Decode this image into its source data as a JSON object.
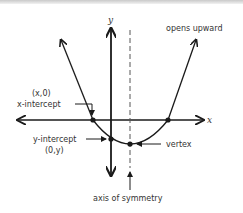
{
  "diagram": {
    "axes": {
      "x_label": "x",
      "y_label": "y"
    },
    "labels": {
      "opens": "opens upward",
      "x_intercept_coord": "(x,0)",
      "x_intercept": "x-intercept",
      "y_intercept": "y-intercept",
      "y_intercept_coord": "(0,y)",
      "vertex": "vertex",
      "axis_of_symmetry": "axis of symmetry"
    },
    "colors": {
      "line": "#1a1a1a",
      "dash": "#555555",
      "text": "#333333"
    }
  }
}
